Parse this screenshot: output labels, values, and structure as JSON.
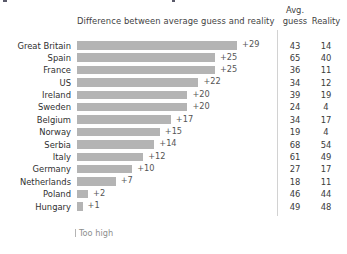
{
  "header": {
    "diff_title": "Difference between average guess and reality",
    "avg_line1": "Avg.",
    "avg_line2": "guess",
    "reality": "Reality"
  },
  "legend": {
    "too_high": "Too high"
  },
  "style": {
    "bar_color": "#b4b4b4",
    "text_color": "#3b3b3b",
    "divider_color": "#d2d2d2",
    "background": "#ffffff"
  },
  "chart_data": {
    "type": "bar",
    "title": "Difference between average guess and reality",
    "xlabel": "",
    "ylabel": "",
    "orientation": "horizontal",
    "grid": false,
    "legend_position": "bottom-left",
    "legend_entries": [
      "Too high"
    ],
    "xlim": [
      0,
      29
    ],
    "px_per_unit": 5.52,
    "categories": [
      "Great Britain",
      "Spain",
      "France",
      "US",
      "Ireland",
      "Sweden",
      "Belgium",
      "Norway",
      "Serbia",
      "Italy",
      "Germany",
      "Netherlands",
      "Poland",
      "Hungary"
    ],
    "series": [
      {
        "name": "Difference between average guess and reality",
        "values": [
          29,
          25,
          25,
          22,
          20,
          20,
          17,
          15,
          14,
          12,
          10,
          7,
          2,
          1
        ],
        "labels": [
          "+29",
          "+25",
          "+25",
          "+22",
          "+20",
          "+20",
          "+17",
          "+15",
          "+14",
          "+12",
          "+10",
          "+7",
          "+2",
          "+1"
        ]
      },
      {
        "name": "Avg. guess",
        "values": [
          43,
          65,
          36,
          34,
          39,
          24,
          34,
          19,
          68,
          61,
          27,
          18,
          46,
          49
        ]
      },
      {
        "name": "Reality",
        "values": [
          14,
          40,
          11,
          12,
          19,
          4,
          17,
          4,
          54,
          49,
          17,
          11,
          44,
          48
        ]
      }
    ],
    "rows": [
      {
        "country": "Great Britain",
        "diff": 29,
        "diff_label": "+29",
        "avg_guess": 43,
        "reality": 14
      },
      {
        "country": "Spain",
        "diff": 25,
        "diff_label": "+25",
        "avg_guess": 65,
        "reality": 40
      },
      {
        "country": "France",
        "diff": 25,
        "diff_label": "+25",
        "avg_guess": 36,
        "reality": 11
      },
      {
        "country": "US",
        "diff": 22,
        "diff_label": "+22",
        "avg_guess": 34,
        "reality": 12
      },
      {
        "country": "Ireland",
        "diff": 20,
        "diff_label": "+20",
        "avg_guess": 39,
        "reality": 19
      },
      {
        "country": "Sweden",
        "diff": 20,
        "diff_label": "+20",
        "avg_guess": 24,
        "reality": 4
      },
      {
        "country": "Belgium",
        "diff": 17,
        "diff_label": "+17",
        "avg_guess": 34,
        "reality": 17
      },
      {
        "country": "Norway",
        "diff": 15,
        "diff_label": "+15",
        "avg_guess": 19,
        "reality": 4
      },
      {
        "country": "Serbia",
        "diff": 14,
        "diff_label": "+14",
        "avg_guess": 68,
        "reality": 54
      },
      {
        "country": "Italy",
        "diff": 12,
        "diff_label": "+12",
        "avg_guess": 61,
        "reality": 49
      },
      {
        "country": "Germany",
        "diff": 10,
        "diff_label": "+10",
        "avg_guess": 27,
        "reality": 17
      },
      {
        "country": "Netherlands",
        "diff": 7,
        "diff_label": "+7",
        "avg_guess": 18,
        "reality": 11
      },
      {
        "country": "Poland",
        "diff": 2,
        "diff_label": "+2",
        "avg_guess": 46,
        "reality": 44
      },
      {
        "country": "Hungary",
        "diff": 1,
        "diff_label": "+1",
        "avg_guess": 49,
        "reality": 48
      }
    ]
  }
}
